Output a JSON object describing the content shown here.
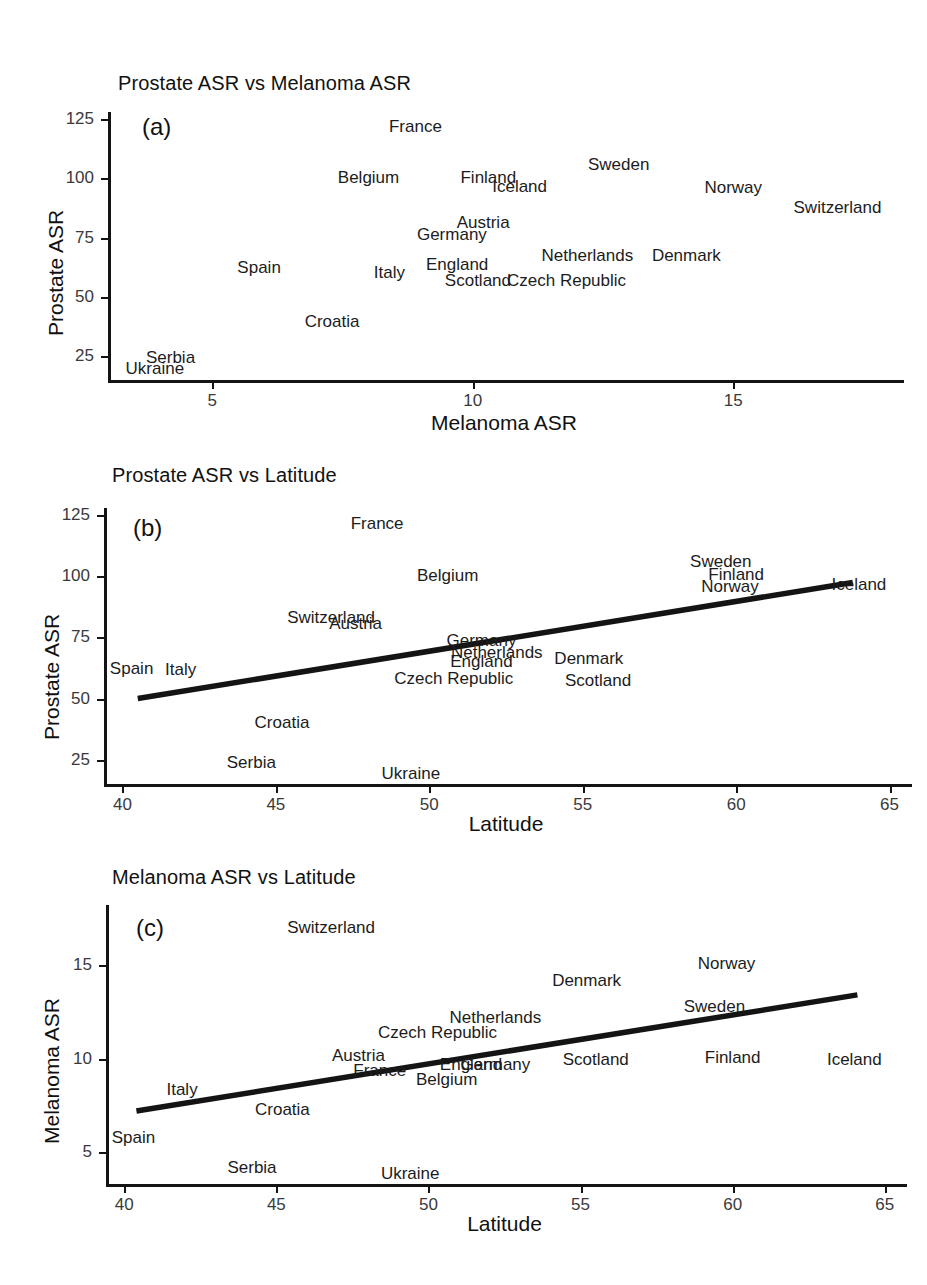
{
  "figure": {
    "background": "#ffffff",
    "text_color": "#1c1c1c",
    "line_color": "#141414",
    "width": 927,
    "height": 1285
  },
  "chart_data": [
    {
      "type": "scatter",
      "panel_tag": "(a)",
      "title": "Prostate ASR vs Melanoma ASR",
      "xlabel": "Melanoma ASR",
      "ylabel": "Prostate ASR",
      "xlim": [
        3.0,
        18.2
      ],
      "ylim": [
        15.0,
        128.0
      ],
      "xticks": [
        5,
        10,
        15
      ],
      "yticks": [
        25,
        50,
        75,
        100,
        125
      ],
      "grid": false,
      "legend": "none",
      "fit_line": null,
      "points": [
        {
          "label": "France",
          "x": 8.9,
          "y": 122.0
        },
        {
          "label": "Sweden",
          "x": 12.8,
          "y": 106.0
        },
        {
          "label": "Belgium",
          "x": 8.0,
          "y": 100.5
        },
        {
          "label": "Finland",
          "x": 10.3,
          "y": 100.5
        },
        {
          "label": "Iceland",
          "x": 10.9,
          "y": 97.0
        },
        {
          "label": "Norway",
          "x": 15.0,
          "y": 96.5
        },
        {
          "label": "Switzerland",
          "x": 17.0,
          "y": 88.0
        },
        {
          "label": "Austria",
          "x": 10.2,
          "y": 81.5
        },
        {
          "label": "Germany",
          "x": 9.6,
          "y": 76.5
        },
        {
          "label": "Netherlands",
          "x": 12.2,
          "y": 67.5
        },
        {
          "label": "Denmark",
          "x": 14.1,
          "y": 67.5
        },
        {
          "label": "England",
          "x": 9.7,
          "y": 64.0
        },
        {
          "label": "Spain",
          "x": 5.9,
          "y": 62.5
        },
        {
          "label": "Italy",
          "x": 8.4,
          "y": 60.5
        },
        {
          "label": "Scotland",
          "x": 10.1,
          "y": 57.0
        },
        {
          "label": "Czech Republic",
          "x": 11.8,
          "y": 57.0
        },
        {
          "label": "Croatia",
          "x": 7.3,
          "y": 40.0
        },
        {
          "label": "Serbia",
          "x": 4.2,
          "y": 24.5
        },
        {
          "label": "Ukraine",
          "x": 3.9,
          "y": 20.0
        }
      ]
    },
    {
      "type": "scatter",
      "panel_tag": "(b)",
      "title": "Prostate ASR vs Latitude",
      "xlabel": "Latitude",
      "ylabel": "Prostate ASR",
      "xlim": [
        39.4,
        65.6
      ],
      "ylim": [
        15.0,
        128.0
      ],
      "xticks": [
        40,
        45,
        50,
        55,
        60,
        65
      ],
      "yticks": [
        25,
        50,
        75,
        100,
        125
      ],
      "grid": false,
      "legend": "none",
      "fit_line": {
        "x0": 40.5,
        "y0": 50.0,
        "x1": 63.8,
        "y1": 97.5
      },
      "points": [
        {
          "label": "France",
          "x": 48.3,
          "y": 122.0
        },
        {
          "label": "Sweden",
          "x": 59.5,
          "y": 106.5
        },
        {
          "label": "Belgium",
          "x": 50.6,
          "y": 100.5
        },
        {
          "label": "Finland",
          "x": 60.0,
          "y": 101.0
        },
        {
          "label": "Norway",
          "x": 59.8,
          "y": 96.0
        },
        {
          "label": "Iceland",
          "x": 64.0,
          "y": 97.0
        },
        {
          "label": "Switzerland",
          "x": 46.8,
          "y": 83.5
        },
        {
          "label": "Austria",
          "x": 47.6,
          "y": 81.0
        },
        {
          "label": "Germany",
          "x": 51.7,
          "y": 74.0
        },
        {
          "label": "Netherlands",
          "x": 52.2,
          "y": 69.0
        },
        {
          "label": "England",
          "x": 51.7,
          "y": 65.5
        },
        {
          "label": "Denmark",
          "x": 55.2,
          "y": 66.5
        },
        {
          "label": "Spain",
          "x": 40.3,
          "y": 62.5
        },
        {
          "label": "Italy",
          "x": 41.9,
          "y": 62.0
        },
        {
          "label": "Czech Republic",
          "x": 50.8,
          "y": 58.5
        },
        {
          "label": "Scotland",
          "x": 55.5,
          "y": 57.5
        },
        {
          "label": "Croatia",
          "x": 45.2,
          "y": 40.5
        },
        {
          "label": "Serbia",
          "x": 44.2,
          "y": 24.0
        },
        {
          "label": "Ukraine",
          "x": 49.4,
          "y": 19.5
        }
      ]
    },
    {
      "type": "scatter",
      "panel_tag": "(c)",
      "title": "Melanoma ASR vs Latitude",
      "xlabel": "Latitude",
      "ylabel": "Melanoma ASR",
      "xlim": [
        39.4,
        65.6
      ],
      "ylim": [
        3.3,
        18.2
      ],
      "xticks": [
        40,
        45,
        50,
        55,
        60,
        65
      ],
      "yticks": [
        5,
        10,
        15
      ],
      "grid": false,
      "legend": "none",
      "fit_line": {
        "x0": 40.4,
        "y0": 7.2,
        "x1": 64.1,
        "y1": 13.4
      },
      "points": [
        {
          "label": "Switzerland",
          "x": 46.8,
          "y": 17.0
        },
        {
          "label": "Norway",
          "x": 59.8,
          "y": 15.1
        },
        {
          "label": "Denmark",
          "x": 55.2,
          "y": 14.2
        },
        {
          "label": "Sweden",
          "x": 59.4,
          "y": 12.8
        },
        {
          "label": "Netherlands",
          "x": 52.2,
          "y": 12.2
        },
        {
          "label": "Czech Republic",
          "x": 50.3,
          "y": 11.4
        },
        {
          "label": "Finland",
          "x": 60.0,
          "y": 10.1
        },
        {
          "label": "Iceland",
          "x": 64.0,
          "y": 10.0
        },
        {
          "label": "Austria",
          "x": 47.7,
          "y": 10.2
        },
        {
          "label": "Scotland",
          "x": 55.5,
          "y": 10.0
        },
        {
          "label": "England",
          "x": 51.4,
          "y": 9.7
        },
        {
          "label": "Germany",
          "x": 52.2,
          "y": 9.7
        },
        {
          "label": "France",
          "x": 48.4,
          "y": 9.4
        },
        {
          "label": "Belgium",
          "x": 50.6,
          "y": 8.9
        },
        {
          "label": "Italy",
          "x": 41.9,
          "y": 8.4
        },
        {
          "label": "Croatia",
          "x": 45.2,
          "y": 7.3
        },
        {
          "label": "Spain",
          "x": 40.3,
          "y": 5.8
        },
        {
          "label": "Serbia",
          "x": 44.2,
          "y": 4.2
        },
        {
          "label": "Ukraine",
          "x": 49.4,
          "y": 3.9
        }
      ]
    }
  ]
}
